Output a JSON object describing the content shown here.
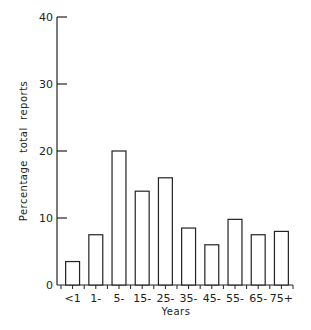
{
  "chart_data": {
    "type": "bar",
    "title": "",
    "xlabel": "Years",
    "ylabel": "Percentage  total  reports",
    "ylim": [
      0,
      40
    ],
    "yticks": [
      0,
      10,
      20,
      30,
      40
    ],
    "ytick_labels": [
      "0",
      "10",
      "20",
      "30",
      "40"
    ],
    "categories": [
      "<1",
      "1-",
      "5-",
      "15-",
      "25-",
      "35-",
      "45-",
      "55-",
      "65-",
      "75+"
    ],
    "values": [
      3.5,
      7.5,
      20,
      14,
      16,
      8.5,
      6,
      9.8,
      7.5,
      8
    ],
    "grid": false,
    "legend": "none",
    "colors": {
      "bar_fill": "#ffffff",
      "bar_stroke": "#222222",
      "axis": "#222222"
    }
  }
}
